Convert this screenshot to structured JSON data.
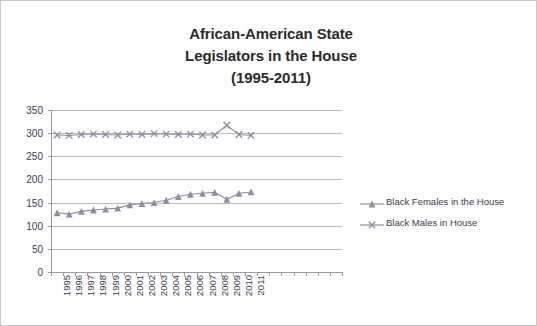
{
  "chart_data": {
    "type": "line",
    "title": "African-American State Legislators in the House (1995-2011)",
    "title_lines": [
      "African-American State",
      "Legislators in the House",
      "(1995-2011)"
    ],
    "xlabel": "",
    "ylabel": "",
    "ylim": [
      0,
      350
    ],
    "ytick_step": 50,
    "yticks": [
      0,
      50,
      100,
      150,
      200,
      250,
      300,
      350
    ],
    "grid": true,
    "legend_position": "right",
    "categories": [
      "1995",
      "1996",
      "1997",
      "1998",
      "1999",
      "2000",
      "2001",
      "2002",
      "2003",
      "2004",
      "2005",
      "2006",
      "2007",
      "2008",
      "2009",
      "2010",
      "2011"
    ],
    "series": [
      {
        "name": "Black Females in the House",
        "marker": "triangle",
        "color": "#8d8da3",
        "values": [
          128,
          125,
          131,
          134,
          136,
          138,
          145,
          148,
          150,
          155,
          163,
          168,
          170,
          172,
          157,
          170,
          173
        ]
      },
      {
        "name": "Black Males in House",
        "marker": "x",
        "color": "#8d8da3",
        "values": [
          296,
          295,
          297,
          298,
          297,
          296,
          298,
          297,
          299,
          298,
          297,
          298,
          296,
          296,
          317,
          297,
          295
        ]
      }
    ]
  },
  "colors": {
    "series": "#8d8da3",
    "grid": "#b9b9b9",
    "axis": "#9a9a9a",
    "text": "#3a3a52",
    "title": "#2b2b2b",
    "frame": "#c9c9c9"
  }
}
